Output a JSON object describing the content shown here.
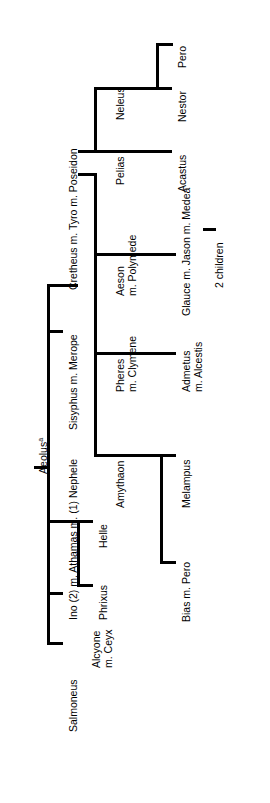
{
  "diagram": {
    "orientation": "rotated-90-ccw",
    "line_color": "#000000",
    "background_color": "#ffffff",
    "nodes": {
      "aeolus": "Aeolus",
      "aeolus_note": "a",
      "salmoneus": "Salmoneus",
      "alcyone_l1": "Alcyone",
      "alcyone_l2": "m. Ceyx",
      "ino_athamas_nephele": "Ino (2) m. Athamas m. (1) Nephele",
      "phrixus": "Phrixus",
      "helle": "Helle",
      "sisyphus_merope": "Sisyphus m. Merope",
      "cretheus_tyro_poseidon": "Cretheus m. Tyro m. Poseidon",
      "amythaon": "Amythaon",
      "melampus": "Melampus",
      "bias_pero": "Bias m. Pero",
      "pheres_l1": "Pheres",
      "pheres_l2": "m. Clymene",
      "admetus_l1": "Admetus",
      "admetus_l2": "m. Alcestis",
      "aeson_l1": "Aeson",
      "aeson_l2": "m. Polymede",
      "glauce_jason_medea": "Glauce m. Jason m. Medea",
      "two_children": "2 children",
      "pelias": "Pelias",
      "acastus": "Acastus",
      "neleus": "Neleus",
      "nestor": "Nestor",
      "pero": "Pero"
    },
    "generations": [
      {
        "parent": "Aeolus",
        "children": [
          "Salmoneus",
          "Alcyone m. Ceyx",
          "Ino (2) m. Athamas m. (1) Nephele",
          "Sisyphus m. Merope",
          "Cretheus m. Tyro m. Poseidon"
        ]
      },
      {
        "parent": "Ino (2) m. Athamas m. (1) Nephele",
        "children": [
          "Phrixus",
          "Helle"
        ]
      },
      {
        "parent": "Cretheus m. Tyro m. Poseidon",
        "children": [
          "Amythaon",
          "Pheres m. Clymene",
          "Aeson m. Polymede",
          "Pelias",
          "Neleus"
        ]
      },
      {
        "parent": "Amythaon",
        "children": [
          "Melampus",
          "Bias m. Pero"
        ]
      },
      {
        "parent": "Pheres m. Clymene",
        "children": [
          "Admetus m. Alcestis"
        ]
      },
      {
        "parent": "Aeson m. Polymede",
        "children": [
          "Glauce m. Jason m. Medea"
        ]
      },
      {
        "parent": "Glauce m. Jason m. Medea",
        "children": [
          "2 children"
        ]
      },
      {
        "parent": "Pelias",
        "children": [
          "Acastus"
        ]
      },
      {
        "parent": "Neleus",
        "children": [
          "Nestor",
          "Pero"
        ]
      }
    ]
  }
}
